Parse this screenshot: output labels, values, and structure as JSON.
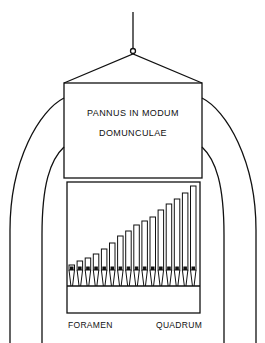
{
  "diagram": {
    "upper_box": {
      "line1": "PANNUS IN MODUM",
      "line2": "DOMUNCULAE"
    },
    "labels": {
      "left": "FORAMEN",
      "right": "QUADRUM"
    },
    "pipes": {
      "count": 16,
      "tops": [
        265,
        261,
        258,
        254,
        249,
        243,
        236,
        231,
        225,
        221,
        217,
        210,
        204,
        199,
        193,
        186
      ]
    },
    "colors": {
      "ink": "#111111",
      "background": "#ffffff"
    }
  }
}
